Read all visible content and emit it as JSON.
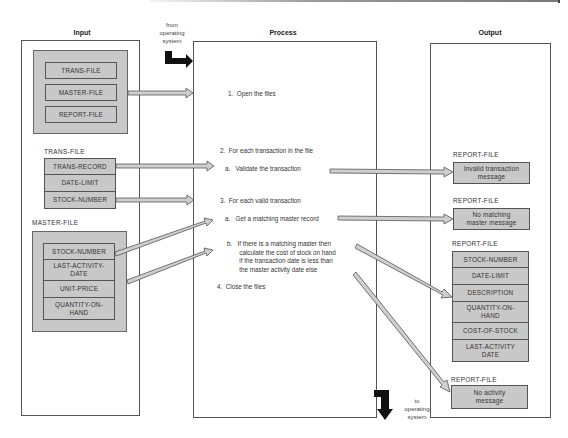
{
  "columns": {
    "input_title": "Input",
    "process_title": "Process",
    "output_title": "Output"
  },
  "flow_notes": {
    "from_os": [
      "from",
      "operating",
      "system"
    ],
    "to_os": [
      "to",
      "operating",
      "system"
    ]
  },
  "input": {
    "files_group": [
      "TRANS-FILE",
      "MASTER-FILE",
      "REPORT-FILE"
    ],
    "trans_file": {
      "label": "TRANS-FILE",
      "fields": [
        "TRANS-RECORD",
        "DATE-LIMIT",
        "STOCK-NUMBER"
      ]
    },
    "master_file": {
      "label": "MASTER-FILE",
      "fields": [
        "STOCK-NUMBER",
        "LAST-ACTIVITY-\nDATE",
        "UNIT-PRICE",
        "QUANTITY-ON-\nHAND"
      ]
    }
  },
  "process": {
    "steps": [
      "1.  Open the files",
      "2.  For each transaction in the file",
      "a.   Validate the transaction",
      "3.  For each valid transaction",
      "a.   Get a matching master record",
      "b.   If there is a matching master then\n       calculate the cost of stock on hand\n       if the transaction date is less than\n       the master activity date else",
      "4.  Close the files"
    ]
  },
  "output": {
    "report1": {
      "label": "REPORT-FILE",
      "message": "Invalid transaction\nmessage"
    },
    "report2": {
      "label": "REPORT-FILE",
      "message": "No matching\nmaster message"
    },
    "report3": {
      "label": "REPORT-FILE",
      "fields": [
        "STOCK-NUMBER",
        "DATE-LIMIT",
        "DESCRIPTION",
        "QUANTITY-ON-\nHAND",
        "COST-OF-STOCK",
        "LAST-ACTIVITY\nDATE"
      ]
    },
    "report4": {
      "label": "REPORT-FILE",
      "message": "No activity\nmessage"
    }
  },
  "colors": {
    "box_fill": "#c8c8c8",
    "border": "#555555",
    "flow_arrow": "#111111"
  }
}
